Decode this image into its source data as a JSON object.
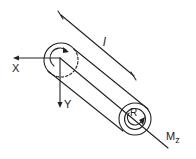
{
  "diagram": {
    "title": "",
    "colors": {
      "ink": "#222222",
      "background": "#ffffff"
    },
    "labels": {
      "x_axis": "X",
      "y_axis": "Y",
      "length": "l",
      "radius": "R",
      "moment": "M",
      "moment_subscript": "z"
    },
    "elements": [
      {
        "id": "cylinder",
        "type": "cylinder-shaft",
        "note": "shaft of length l and radius R"
      },
      {
        "id": "x-axis",
        "type": "arrow",
        "label": "X"
      },
      {
        "id": "y-axis",
        "type": "arrow",
        "label": "Y"
      },
      {
        "id": "length-dimension",
        "type": "dimension-line",
        "label": "l"
      },
      {
        "id": "torque-left",
        "type": "curved-arrow"
      },
      {
        "id": "torque-right",
        "type": "curved-arrow"
      },
      {
        "id": "moment-axis",
        "type": "axis-line",
        "label": "Mz"
      }
    ]
  }
}
